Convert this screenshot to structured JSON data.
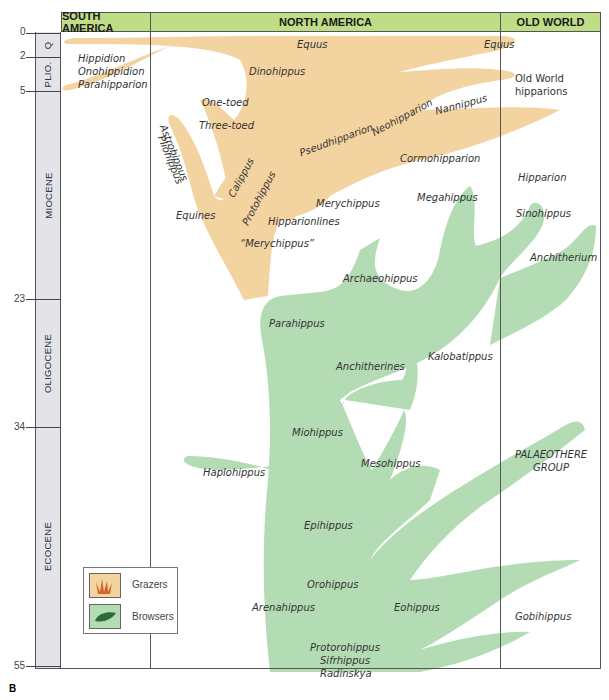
{
  "figure_label": "B",
  "columns": [
    {
      "id": "south-america",
      "label": "SOUTH AMERICA"
    },
    {
      "id": "north-america",
      "label": "NORTH AMERICA"
    },
    {
      "id": "old-world",
      "label": "OLD WORLD"
    }
  ],
  "timescale": {
    "ticks": [
      "0",
      "2",
      "5",
      "23",
      "34",
      "55"
    ],
    "epochs": [
      "Q",
      "PLIO.",
      "MIOCENE",
      "OLIGOCENE",
      "ECOCENE"
    ]
  },
  "legend": {
    "grazers": "Grazers",
    "browsers": "Browsers"
  },
  "colors": {
    "grazer_fill": "#f3d3a0",
    "browser_fill": "#b4dcb4",
    "header_fill": "#bfdc86",
    "timebar_fill": "#e3e4ea",
    "grass_icon": "#d2642a",
    "leaf_icon": "#2e6b3c"
  },
  "labels": {
    "south_america": [
      "Hippidion",
      "Onohippidion",
      "Parahipparion"
    ],
    "equus_na": "Equus",
    "equus_ow": "Equus",
    "dinohippus": "Dinohippus",
    "one_toed": "One-toed",
    "three_toed": "Three-toed",
    "pliohippus": "Pliohippus",
    "astrohippus": "Astrohippus",
    "calippus": "Calippus",
    "protohippus": "Protohippus",
    "equines": "Equines",
    "merychippus_quoted": "“Merychippus”",
    "hipparionlines": "Hipparionlines",
    "merychippus": "Merychippus",
    "pseudhipparion": "Pseudhipparion",
    "neohipparion": "Neohipparion",
    "nannippus": "Nannippus",
    "cormohipparion": "Cormohipparion",
    "old_world_hipparions": "Old World hipparions",
    "hipparion": "Hipparion",
    "megahippus": "Megahippus",
    "sinohippus": "Sinohippus",
    "archaeohippus": "Archaeohippus",
    "anchitherium": "Anchitherium",
    "parahippus": "Parahippus",
    "anchitherines": "Anchitherines",
    "kalobatippus": "Kalobatippus",
    "miohippus": "Miohippus",
    "mesohippus": "Mesohippus",
    "haplohippus": "Haplohippus",
    "epihippus": "Epihippus",
    "palaeothere_group": "PALAEOTHERE GROUP",
    "orohippus": "Orohippus",
    "arenahippus": "Arenahippus",
    "eohippus": "Eohippus",
    "gobihippus": "Gobihippus",
    "base_group": [
      "Protorohippus",
      "Sifrhippus",
      "Radinskya"
    ]
  }
}
